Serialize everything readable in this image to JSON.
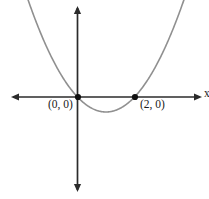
{
  "figure": {
    "background_color": "#ffffff",
    "width": 209,
    "height": 199
  },
  "axes": {
    "x_axis_label": "x",
    "axis_color": "#2b2b2b",
    "origin_px": {
      "x": 77.5,
      "y": 97
    },
    "x_axis_span_px": {
      "from": 11,
      "to": 202
    },
    "y_axis_span_px": {
      "from": 6,
      "to": 192
    },
    "arrow_heads": [
      "left",
      "right",
      "up",
      "down"
    ]
  },
  "curve": {
    "color": "#909090",
    "stroke_width": 1.6
  },
  "points": [
    {
      "name": "origin",
      "label": "(0, 0)",
      "x": 0,
      "y": 0,
      "px": {
        "x": 78,
        "y": 97
      },
      "dot_color": "#111111"
    },
    {
      "name": "root-two",
      "label": "(2, 0)",
      "x": 2,
      "y": 0,
      "px": {
        "x": 135,
        "y": 97
      },
      "dot_color": "#111111"
    }
  ],
  "chart_data": {
    "type": "line",
    "title": "",
    "xlabel": "x",
    "ylabel": "",
    "grid": false,
    "legend": false,
    "function": "y = x(x - 2)",
    "roots": [
      0,
      2
    ],
    "vertex": {
      "x": 1,
      "y": -1
    },
    "annotations": [
      "(0, 0)",
      "(2, 0)"
    ],
    "x": [
      -2.1,
      -1.8,
      -1.5,
      -1.2,
      -0.9,
      -0.6,
      -0.3,
      0,
      0.3,
      0.6,
      0.9,
      1,
      1.1,
      1.4,
      1.7,
      2,
      2.3,
      2.6,
      2.9,
      3.2,
      3.5,
      3.8,
      4.1
    ],
    "values": [
      8.61,
      6.84,
      5.25,
      3.84,
      2.61,
      1.56,
      0.69,
      0,
      -0.51,
      -0.84,
      -0.99,
      -1,
      -0.99,
      -0.84,
      -0.51,
      0,
      0.69,
      1.56,
      2.61,
      3.84,
      5.25,
      6.84,
      8.61
    ],
    "xlim": [
      -2.35,
      4.35
    ],
    "ylim": [
      -3.4,
      9.0
    ]
  }
}
